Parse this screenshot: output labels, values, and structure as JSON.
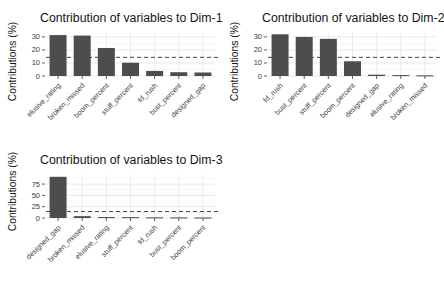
{
  "page": {
    "background": "#ffffff",
    "text_color": "#141414",
    "grid_major_color": "#e5e5e5",
    "grid_minor_color": "#f2f2f2",
    "axis_text_color": "#3c3c3c"
  },
  "chart_data": [
    {
      "type": "bar",
      "title": "Contribution of variables to Dim-1",
      "ylabel": "Contributions (%)",
      "xlabel": "",
      "categories": [
        "elusive_rating",
        "broken_missed",
        "boom_percent",
        "stuff_percent",
        "fd_rush",
        "bust_percent",
        "designed_gap"
      ],
      "values": [
        31.4,
        31.0,
        21.5,
        10.2,
        3.9,
        2.9,
        2.7
      ],
      "yticks": [
        0,
        10,
        20,
        30
      ],
      "ylim": [
        0,
        33
      ],
      "ref_line": 14.29,
      "ref_line_style": "dashed",
      "ref_line_color": "#4a4a4a",
      "bar_color": "#4d4d4d",
      "grid": true,
      "legend": "none",
      "x_tick_angle": 45
    },
    {
      "type": "bar",
      "title": "Contribution of variables to Dim-2",
      "ylabel": "Contributions (%)",
      "xlabel": "",
      "categories": [
        "fd_rush",
        "bust_percent",
        "stuff_percent",
        "boom_percent",
        "designed_gap",
        "elusive_rating",
        "broken_missed"
      ],
      "values": [
        32.0,
        30.0,
        28.5,
        11.3,
        1.0,
        0.7,
        0.5
      ],
      "yticks": [
        0,
        10,
        20,
        30
      ],
      "ylim": [
        0,
        33
      ],
      "ref_line": 14.29,
      "ref_line_style": "dashed",
      "ref_line_color": "#4a4a4a",
      "bar_color": "#4d4d4d",
      "grid": true,
      "legend": "none",
      "x_tick_angle": 45
    },
    {
      "type": "bar",
      "title": "Contribution of variables to Dim-3",
      "ylabel": "Contributions (%)",
      "xlabel": "",
      "categories": [
        "designed_gap",
        "broken_missed",
        "elusive_rating",
        "stuff_percent",
        "fd_rush",
        "bust_percent",
        "boom_percent"
      ],
      "values": [
        91.0,
        4.1,
        2.1,
        1.9,
        1.5,
        1.3,
        1.1
      ],
      "yticks": [
        0,
        25,
        50,
        75
      ],
      "ylim": [
        0,
        95
      ],
      "ref_line": 14.29,
      "ref_line_style": "dashed",
      "ref_line_color": "#4a4a4a",
      "bar_color": "#4d4d4d",
      "grid": true,
      "legend": "none",
      "x_tick_angle": 45
    }
  ]
}
